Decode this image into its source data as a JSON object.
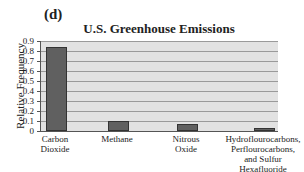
{
  "panel": {
    "label": "(d)"
  },
  "chart_data": {
    "type": "bar",
    "title": "U.S. Greenhouse Emissions",
    "xlabel": "",
    "ylabel": "Relative Frequency",
    "categories": [
      "Carbon\nDioxide",
      "Methane",
      "Nitrous\nOxide",
      "Hydroflourocarbons,\nPerflourocarbons,\nand Sulfur\nHexafluoride"
    ],
    "values": [
      0.84,
      0.1,
      0.07,
      0.03
    ],
    "ylim": [
      0,
      0.9
    ],
    "yticks": [
      "0",
      "0.1",
      "0.2",
      "0.3",
      "0.4",
      "0.5",
      "0.6",
      "0.7",
      "0.8",
      "0.9"
    ],
    "grid": true,
    "legend": null,
    "colors": {
      "bar": "#606060",
      "plot_bg": "#e2e2e2",
      "grid": "#9a9a9a"
    }
  }
}
